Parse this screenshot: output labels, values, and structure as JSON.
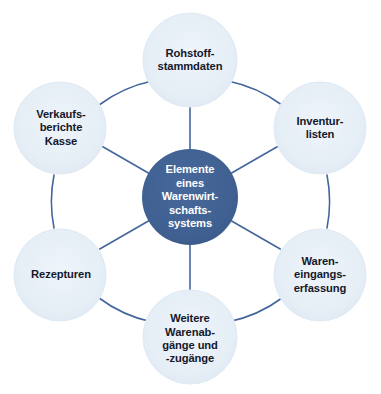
{
  "diagram": {
    "type": "hub-and-spoke-radial",
    "title_text": "Elemente eines Warenwirtschaftssystems",
    "colors": {
      "background": "#ffffff",
      "hub_fill": "#416architecture",
      "hub_fill_hex": "#40619150",
      "hub_blue": "#3f6091",
      "satellite_fill": "#e6eef6",
      "satellite_edge": "#dce8f2",
      "connector_line": "#44669c",
      "hub_text": "#ffffff",
      "satellite_text": "#14182b"
    },
    "hub": {
      "name": "central-hub",
      "lines": [
        "Elemente",
        "eines",
        "Warenwirt-",
        "schafts-",
        "systems"
      ],
      "cx": 190,
      "cy": 197,
      "r": 48
    },
    "satellites": [
      {
        "id": "rohstoffstammdaten",
        "lines": [
          "Rohstoff-",
          "stammdaten"
        ],
        "cx": 190,
        "cy": 60,
        "r": 47,
        "angle_deg": -90
      },
      {
        "id": "inventurlisten",
        "lines": [
          "Inventur-",
          "listen"
        ],
        "cx": 320,
        "cy": 128,
        "r": 46,
        "angle_deg": -30
      },
      {
        "id": "wareneingangserfassung",
        "lines": [
          "Waren-",
          "eingangs-",
          "erfassung"
        ],
        "cx": 320,
        "cy": 275,
        "r": 46,
        "angle_deg": 30
      },
      {
        "id": "weitere-warenabgaenge-zugaenge",
        "lines": [
          "Weitere",
          "Warenab-",
          "gänge und",
          "-zugänge"
        ],
        "cx": 190,
        "cy": 337,
        "r": 47,
        "angle_deg": 90
      },
      {
        "id": "rezepturen",
        "lines": [
          "Rezepturen"
        ],
        "cx": 60,
        "cy": 275,
        "r": 46,
        "angle_deg": 150
      },
      {
        "id": "verkaufsberichte-kasse",
        "lines": [
          "Verkaufs-",
          "berichte",
          "Kasse"
        ],
        "cx": 60,
        "cy": 128,
        "r": 46,
        "angle_deg": 210
      }
    ],
    "connections": {
      "spokes_from_hub_to_each_satellite": true,
      "ring_arcs_between_adjacent_satellites": true,
      "ring_radius": 137,
      "line_width": 1.6
    }
  }
}
